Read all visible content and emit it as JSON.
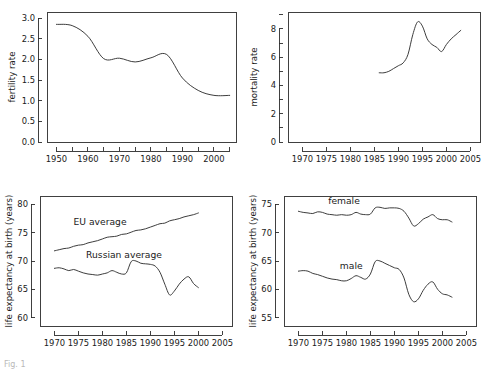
{
  "figure": {
    "caption": "Fig. 1",
    "background_color": "#ffffff",
    "line_color": "#333333",
    "axis_color": "#2b2b2b"
  },
  "chart_data": [
    {
      "id": "fertility",
      "type": "line",
      "title": "",
      "xlabel": "",
      "ylabel": "fertility rate",
      "xlim": [
        1947,
        2007
      ],
      "ylim": [
        0.0,
        3.15
      ],
      "grid": false,
      "legend_position": "none",
      "xticks": [
        1950,
        1960,
        1970,
        1980,
        1990,
        2000
      ],
      "xtick_labels": [
        "1950",
        "1960",
        "1970",
        "1980",
        "1990",
        "2000"
      ],
      "xminor": [
        1955,
        1965,
        1975,
        1985,
        1995,
        2005
      ],
      "yticks": [
        0.0,
        0.5,
        1.0,
        1.5,
        2.0,
        2.5,
        3.0
      ],
      "ytick_labels": [
        "0.0",
        "0.5",
        "1.0",
        "1.5",
        "2.0",
        "2.5",
        "3.0"
      ],
      "series": [
        {
          "name": "fertility rate",
          "x": [
            1950,
            1955,
            1960,
            1965,
            1970,
            1975,
            1980,
            1985,
            1990,
            1995,
            2000,
            2005
          ],
          "values": [
            2.85,
            2.82,
            2.56,
            2.02,
            2.03,
            1.94,
            2.04,
            2.12,
            1.55,
            1.25,
            1.13,
            1.13
          ]
        }
      ]
    },
    {
      "id": "mortality",
      "type": "line",
      "title": "",
      "xlabel": "",
      "ylabel": "mortality rate",
      "xlim": [
        1967,
        2007
      ],
      "ylim": [
        0,
        9.2
      ],
      "grid": false,
      "legend_position": "none",
      "xticks": [
        1970,
        1975,
        1980,
        1985,
        1990,
        1995,
        2000,
        2005
      ],
      "xtick_labels": [
        "1970",
        "1975",
        "1980",
        "1985",
        "1990",
        "1995",
        "2000",
        "2005"
      ],
      "yticks": [
        0,
        2,
        4,
        6,
        8
      ],
      "ytick_labels": [
        "0",
        "2",
        "4",
        "6",
        "8"
      ],
      "yminor": [
        1,
        3,
        5,
        7,
        9
      ],
      "series": [
        {
          "name": "mortality rate",
          "x": [
            1986,
            1987,
            1988,
            1989,
            1990,
            1991,
            1992,
            1993,
            1994,
            1995,
            1996,
            1997,
            1998,
            1999,
            2000,
            2001,
            2002,
            2003
          ],
          "values": [
            4.9,
            4.9,
            5.0,
            5.2,
            5.4,
            5.6,
            6.2,
            7.6,
            8.5,
            8.2,
            7.3,
            6.9,
            6.7,
            6.4,
            6.9,
            7.3,
            7.6,
            7.9
          ]
        }
      ]
    },
    {
      "id": "life-expectancy-comparison",
      "type": "line",
      "title": "",
      "xlabel": "",
      "ylabel": "life expectancy at birth (years)",
      "xlim": [
        1967,
        2007
      ],
      "ylim": [
        58.5,
        81.5
      ],
      "grid": false,
      "legend_position": "inline",
      "xticks": [
        1970,
        1975,
        1980,
        1985,
        1990,
        1995,
        2000,
        2005
      ],
      "xtick_labels": [
        "1970",
        "1975",
        "1980",
        "1985",
        "1990",
        "1995",
        "2000",
        "2005"
      ],
      "yticks": [
        60,
        65,
        70,
        75,
        80
      ],
      "ytick_labels": [
        "60",
        "65",
        "70",
        "75",
        "80"
      ],
      "series": [
        {
          "name": "EU average",
          "label": "EU average",
          "label_x": 1979.5,
          "label_y": 76.3,
          "x": [
            1970,
            1971,
            1972,
            1973,
            1974,
            1975,
            1976,
            1977,
            1978,
            1979,
            1980,
            1981,
            1982,
            1983,
            1984,
            1985,
            1986,
            1987,
            1988,
            1989,
            1990,
            1991,
            1992,
            1993,
            1994,
            1995,
            1996,
            1997,
            1998,
            1999,
            2000
          ],
          "values": [
            71.8,
            72.0,
            72.2,
            72.3,
            72.6,
            72.8,
            72.9,
            73.2,
            73.4,
            73.6,
            73.9,
            74.2,
            74.3,
            74.4,
            74.7,
            74.8,
            75.1,
            75.4,
            75.5,
            75.7,
            76.0,
            76.3,
            76.6,
            76.7,
            77.1,
            77.3,
            77.5,
            77.8,
            78.0,
            78.2,
            78.5
          ]
        },
        {
          "name": "Russian average",
          "label": "Russian average",
          "label_x": 1984.5,
          "label_y": 70.6,
          "x": [
            1970,
            1971,
            1972,
            1973,
            1974,
            1975,
            1976,
            1977,
            1978,
            1979,
            1980,
            1981,
            1982,
            1983,
            1984,
            1985,
            1986,
            1987,
            1988,
            1989,
            1990,
            1991,
            1992,
            1993,
            1994,
            1995,
            1996,
            1997,
            1998,
            1999,
            2000
          ],
          "values": [
            68.7,
            68.8,
            68.6,
            68.3,
            68.5,
            68.2,
            67.9,
            67.7,
            67.6,
            67.5,
            67.7,
            67.9,
            68.3,
            68.0,
            67.7,
            67.9,
            69.9,
            70.0,
            69.6,
            69.5,
            69.4,
            69.1,
            68.0,
            65.9,
            64.0,
            64.7,
            65.9,
            66.8,
            67.2,
            66.0,
            65.3
          ]
        }
      ]
    },
    {
      "id": "life-expectancy-by-sex",
      "type": "line",
      "title": "",
      "xlabel": "",
      "ylabel": "life expectancy at birth (years)",
      "xlim": [
        1967,
        2007
      ],
      "ylim": [
        53.5,
        76.5
      ],
      "grid": false,
      "legend_position": "inline",
      "xticks": [
        1970,
        1975,
        1980,
        1985,
        1990,
        1995,
        2000,
        2005
      ],
      "xtick_labels": [
        "1970",
        "1975",
        "1980",
        "1985",
        "1990",
        "1995",
        "2000",
        "2005"
      ],
      "yticks": [
        55,
        60,
        65,
        70,
        75
      ],
      "ytick_labels": [
        "55",
        "60",
        "65",
        "70",
        "75"
      ],
      "series": [
        {
          "name": "female",
          "label": "female",
          "label_x": 1979.5,
          "label_y": 75.1,
          "x": [
            1970,
            1971,
            1972,
            1973,
            1974,
            1975,
            1976,
            1977,
            1978,
            1979,
            1980,
            1981,
            1982,
            1983,
            1984,
            1985,
            1986,
            1987,
            1988,
            1989,
            1990,
            1991,
            1992,
            1993,
            1994,
            1995,
            1996,
            1997,
            1998,
            1999,
            2000,
            2001,
            2002
          ],
          "values": [
            73.8,
            73.6,
            73.5,
            73.4,
            73.7,
            73.6,
            73.3,
            73.2,
            73.1,
            73.2,
            73.1,
            73.2,
            73.6,
            73.3,
            73.2,
            73.3,
            74.4,
            74.5,
            74.3,
            74.4,
            74.4,
            74.3,
            73.8,
            72.6,
            71.2,
            71.6,
            72.4,
            72.8,
            73.2,
            72.5,
            72.3,
            72.3,
            71.9
          ]
        },
        {
          "name": "male",
          "label": "male",
          "label_x": 1981.0,
          "label_y": 63.6,
          "x": [
            1970,
            1971,
            1972,
            1973,
            1974,
            1975,
            1976,
            1977,
            1978,
            1979,
            1980,
            1981,
            1982,
            1983,
            1984,
            1985,
            1986,
            1987,
            1988,
            1989,
            1990,
            1991,
            1992,
            1993,
            1994,
            1995,
            1996,
            1997,
            1998,
            1999,
            2000,
            2001,
            2002
          ],
          "values": [
            63.2,
            63.3,
            63.2,
            62.8,
            62.6,
            62.3,
            62.0,
            61.8,
            61.7,
            61.5,
            61.5,
            61.9,
            62.4,
            62.1,
            61.8,
            62.7,
            64.9,
            65.0,
            64.6,
            64.2,
            63.8,
            63.5,
            62.0,
            59.1,
            57.8,
            58.3,
            59.8,
            60.9,
            61.3,
            60.0,
            59.2,
            59.0,
            58.6
          ]
        }
      ]
    }
  ]
}
